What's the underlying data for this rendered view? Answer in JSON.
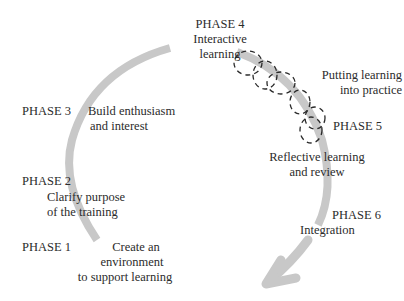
{
  "diagram": {
    "type": "cyclical-phase-diagram",
    "arc_color": "#c8c8c8",
    "dashed_color": "#2a2a2a",
    "phases": [
      {
        "id": "phase1",
        "label": "PHASE 1",
        "line1": "Create an",
        "line2": "environment",
        "line3": "to support learning"
      },
      {
        "id": "phase2",
        "label": "PHASE 2",
        "line1": "Clarify purpose",
        "line2": "of the training"
      },
      {
        "id": "phase3",
        "label": "PHASE 3",
        "line1": "Build enthusiasm",
        "line2": "and interest"
      },
      {
        "id": "phase4",
        "label": "PHASE 4",
        "line1": "Interactive",
        "line2": "learning"
      },
      {
        "id": "phase5",
        "label": "PHASE 5",
        "pre1": "Putting learning",
        "pre2": "into practice",
        "line1": "Reflective learning",
        "line2": "and review"
      },
      {
        "id": "phase6",
        "label": "PHASE 6",
        "line1": "Integration"
      }
    ]
  }
}
